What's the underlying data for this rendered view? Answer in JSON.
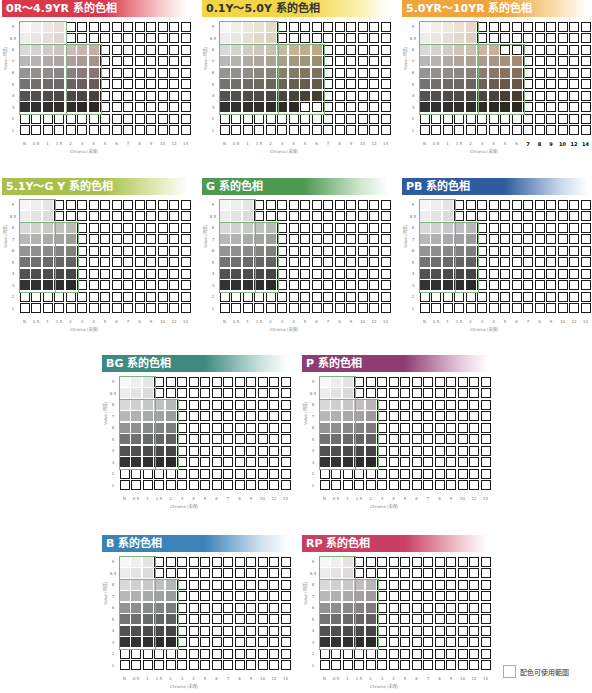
{
  "chart_data": {
    "type": "heatmap",
    "xlabel": "Chroma (彩度)",
    "ylabel": "Value (明度)",
    "x_ticks": [
      "N",
      "0.5",
      "1",
      "1.5",
      "2",
      "3",
      "4",
      "5",
      "6",
      "7",
      "8",
      "9",
      "10",
      "12",
      "14"
    ],
    "y_ticks": [
      "9",
      "8.5",
      "8",
      "7",
      "6",
      "5",
      "4",
      "3",
      "2",
      "1"
    ],
    "legend": "配色可使用範圍",
    "panels": [
      {
        "title": "0R～4.9YR 系的色相",
        "left": 0,
        "top": 0,
        "color": "#d9394a",
        "fade": "#f7c9c9",
        "tone": [
          120,
          70,
          55
        ],
        "filled_cols_per_row": [
          4,
          4,
          7,
          7,
          7,
          7,
          7,
          7,
          0,
          0
        ]
      },
      {
        "title": "0.1Y～5.0Y 系的色相",
        "left": 200,
        "top": 0,
        "color": "#f2d645",
        "fade": "#fbf1b0",
        "tone": [
          110,
          85,
          30
        ],
        "filled_cols_per_row": [
          5,
          5,
          9,
          9,
          9,
          9,
          9,
          7,
          0,
          0
        ]
      },
      {
        "title": "5.0YR～10YR 系的色相",
        "left": 400,
        "top": 0,
        "color": "#f0a43b",
        "fade": "#fbe2b8",
        "tone": [
          125,
          75,
          35
        ],
        "filled_cols_per_row": [
          5,
          5,
          7,
          9,
          9,
          9,
          9,
          9,
          0,
          0
        ],
        "bold_ticks": [
          "7",
          "8",
          "9",
          "10",
          "12",
          "14"
        ]
      },
      {
        "title": "5.1Y～G Y 系的色相",
        "left": 0,
        "top": 178,
        "color": "#a7c14a",
        "fade": "#e3edbf",
        "tone": [
          60,
          70,
          45
        ],
        "filled_cols_per_row": [
          3,
          3,
          5,
          5,
          5,
          5,
          5,
          5,
          0,
          0
        ]
      },
      {
        "title": "G 系的色相",
        "left": 200,
        "top": 178,
        "color": "#4e9a53",
        "fade": "#cfe6cf",
        "tone": [
          50,
          70,
          50
        ],
        "filled_cols_per_row": [
          3,
          3,
          5,
          5,
          5,
          5,
          5,
          5,
          0,
          0
        ]
      },
      {
        "title": "PB 系的色相",
        "left": 400,
        "top": 178,
        "color": "#2e5c9e",
        "fade": "#c9d7ec",
        "tone": [
          55,
          55,
          65
        ],
        "filled_cols_per_row": [
          3,
          3,
          5,
          5,
          5,
          5,
          5,
          5,
          0,
          0
        ]
      },
      {
        "title": "BG 系的色相",
        "left": 100,
        "top": 355,
        "color": "#3f8a80",
        "fade": "#c8e2de",
        "tone": [
          50,
          65,
          60
        ],
        "filled_cols_per_row": [
          3,
          3,
          5,
          5,
          5,
          5,
          5,
          5,
          0,
          0
        ]
      },
      {
        "title": "P 系的色相",
        "left": 300,
        "top": 355,
        "color": "#8d3d73",
        "fade": "#e6c8dc",
        "tone": [
          60,
          50,
          58
        ],
        "filled_cols_per_row": [
          3,
          3,
          5,
          5,
          5,
          5,
          5,
          5,
          0,
          0
        ]
      },
      {
        "title": "B 系的色相",
        "left": 100,
        "top": 535,
        "color": "#3b82b8",
        "fade": "#cde0ef",
        "tone": [
          50,
          58,
          62
        ],
        "filled_cols_per_row": [
          3,
          3,
          5,
          5,
          5,
          5,
          5,
          5,
          0,
          0
        ]
      },
      {
        "title": "RP 系的色相",
        "left": 300,
        "top": 535,
        "color": "#c8405f",
        "fade": "#f1c9d2",
        "tone": [
          65,
          50,
          52
        ],
        "filled_cols_per_row": [
          3,
          3,
          5,
          5,
          5,
          5,
          5,
          5,
          0,
          0
        ]
      }
    ]
  }
}
